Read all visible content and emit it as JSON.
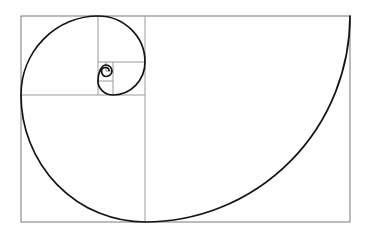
{
  "diagram": {
    "name": "fibonacci-golden-spiral",
    "background_color": "#ffffff",
    "border_color": "#787878",
    "divider_color": "#9a9a9a",
    "spiral_color": "#141414",
    "border_stroke_width": 1,
    "divider_stroke_width": 1,
    "spiral_stroke_width": 1.7,
    "canvas": {
      "width": 370,
      "height": 241
    },
    "outer_rect": {
      "x": 21,
      "y": 16,
      "width": 329,
      "height": 206
    },
    "dividers": [
      {
        "name": "main-vertical",
        "x1": 145,
        "y1": 16,
        "x2": 145,
        "y2": 222
      },
      {
        "name": "left-horizontal",
        "x1": 21,
        "y1": 95,
        "x2": 145,
        "y2": 95
      },
      {
        "name": "upper-left-vertical",
        "x1": 98,
        "y1": 16,
        "x2": 98,
        "y2": 95
      },
      {
        "name": "upper-mid-horizontal",
        "x1": 98,
        "y1": 62,
        "x2": 145,
        "y2": 62
      },
      {
        "name": "small-vertical",
        "x1": 113,
        "y1": 62,
        "x2": 113,
        "y2": 95
      },
      {
        "name": "small-horizontal",
        "x1": 98,
        "y1": 81,
        "x2": 113,
        "y2": 81
      },
      {
        "name": "tiny-vertical",
        "x1": 106,
        "y1": 62,
        "x2": 106,
        "y2": 71
      },
      {
        "name": "tiny-horizontal",
        "x1": 106,
        "y1": 71,
        "x2": 113,
        "y2": 71
      }
    ],
    "spiral": {
      "start_point": {
        "x": 350,
        "y": 16
      },
      "arcs": [
        {
          "rx": 205,
          "ry": 206,
          "x": 145,
          "y": 222
        },
        {
          "rx": 124,
          "ry": 127,
          "x": 21,
          "y": 95
        },
        {
          "rx": 77,
          "ry": 79,
          "x": 98,
          "y": 16
        },
        {
          "rx": 47,
          "ry": 46,
          "x": 145,
          "y": 62
        },
        {
          "rx": 32,
          "ry": 33,
          "x": 113,
          "y": 95
        },
        {
          "rx": 15,
          "ry": 14,
          "x": 98,
          "y": 81
        },
        {
          "rx": 8,
          "ry": 16,
          "x": 106,
          "y": 65
        },
        {
          "rx": 6,
          "ry": 6,
          "x": 112,
          "y": 71
        },
        {
          "rx": 6,
          "ry": 5.5,
          "x": 106,
          "y": 76.5
        },
        {
          "rx": 4.5,
          "ry": 5.5,
          "x": 101.5,
          "y": 71
        },
        {
          "rx": 4.5,
          "ry": 3.5,
          "x": 106,
          "y": 67.5
        },
        {
          "rx": 3,
          "ry": 3,
          "x": 109,
          "y": 70.5
        }
      ]
    }
  }
}
